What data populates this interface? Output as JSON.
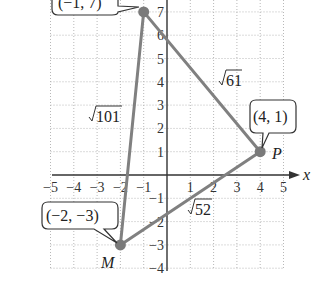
{
  "figure": {
    "type": "coordinate-plane-triangle",
    "x_axis_label": "x",
    "x_ticks": [
      "−5",
      "−4",
      "−3",
      "−2",
      "−1",
      "1",
      "2",
      "3",
      "4",
      "5"
    ],
    "y_ticks": [
      "7",
      "6",
      "5",
      "4",
      "3",
      "2",
      "1",
      "−1",
      "−2",
      "−3",
      "−4"
    ],
    "x_range": [
      -5,
      5
    ],
    "y_range": [
      -4,
      7
    ],
    "points": [
      {
        "id": "top",
        "x": -1,
        "y": 7,
        "callout": "(−1, 7)",
        "name": ""
      },
      {
        "id": "P",
        "x": 4,
        "y": 1,
        "callout": "(4, 1)",
        "name": "P"
      },
      {
        "id": "M",
        "x": -2,
        "y": -3,
        "callout": "(−2, −3)",
        "name": "M"
      }
    ],
    "sides": [
      {
        "from": "M",
        "to": "top",
        "length_label": "√101",
        "radicand": "101"
      },
      {
        "from": "top",
        "to": "P",
        "length_label": "√61",
        "radicand": "61"
      },
      {
        "from": "M",
        "to": "P",
        "length_label": "√52",
        "radicand": "52"
      }
    ],
    "colors": {
      "edge": "#808080",
      "point": "#7a7a7a",
      "axis": "#333333",
      "grid": "#b8b8b8"
    }
  }
}
